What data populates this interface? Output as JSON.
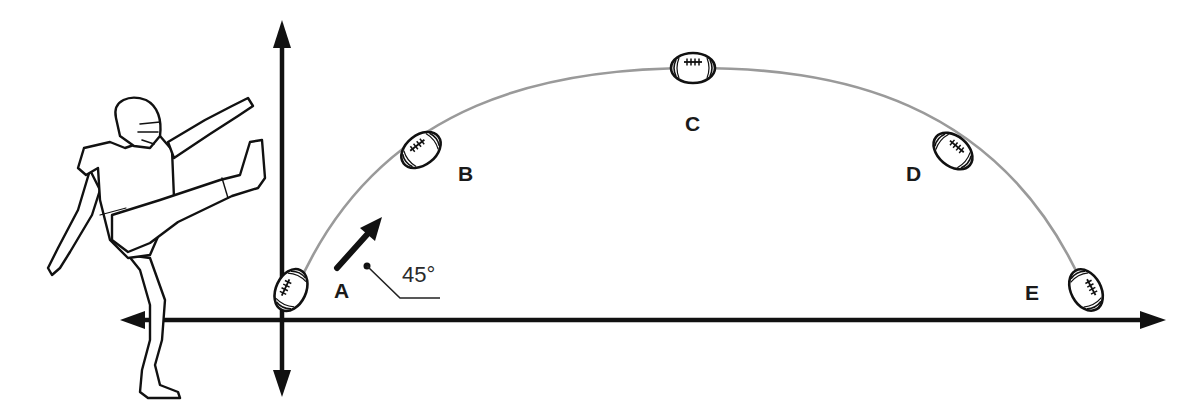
{
  "diagram": {
    "axes": {
      "horizontal": "double-headed arrow",
      "vertical": "double-headed arrow"
    },
    "launch_angle_label": "45°",
    "points": [
      {
        "id": "A",
        "label": "A",
        "description": "launch point at ground"
      },
      {
        "id": "B",
        "label": "B",
        "description": "rising"
      },
      {
        "id": "C",
        "label": "C",
        "description": "peak of trajectory"
      },
      {
        "id": "D",
        "label": "D",
        "description": "descending"
      },
      {
        "id": "E",
        "label": "E",
        "description": "landing point at ground"
      }
    ],
    "figure": "kicker-with-raised-leg",
    "colors": {
      "ink": "#111111",
      "trajectory": "#9a9a9a",
      "background": "#ffffff"
    }
  }
}
